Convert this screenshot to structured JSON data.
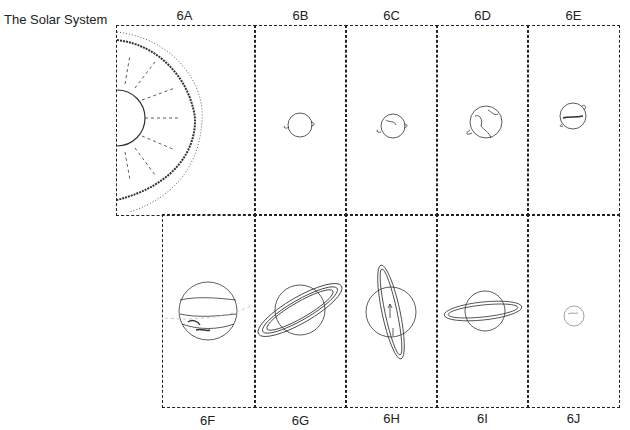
{
  "title": "The Solar System",
  "panels": [
    {
      "id": "6A",
      "label": "6A",
      "subject": "sun"
    },
    {
      "id": "6B",
      "label": "6B",
      "subject": "mercury"
    },
    {
      "id": "6C",
      "label": "6C",
      "subject": "venus"
    },
    {
      "id": "6D",
      "label": "6D",
      "subject": "earth"
    },
    {
      "id": "6E",
      "label": "6E",
      "subject": "mars"
    },
    {
      "id": "6F",
      "label": "6F",
      "subject": "jupiter"
    },
    {
      "id": "6G",
      "label": "6G",
      "subject": "saturn"
    },
    {
      "id": "6H",
      "label": "6H",
      "subject": "uranus"
    },
    {
      "id": "6I",
      "label": "6I",
      "subject": "neptune"
    },
    {
      "id": "6J",
      "label": "6J",
      "subject": "pluto"
    }
  ]
}
